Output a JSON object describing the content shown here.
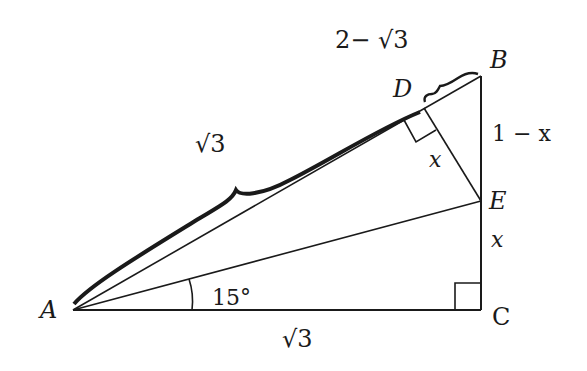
{
  "diagram": {
    "type": "geometry-triangle",
    "colors": {
      "stroke": "#1a1a1a",
      "background": "#ffffff"
    },
    "points": {
      "A": {
        "label": "A"
      },
      "B": {
        "label": "B"
      },
      "C": {
        "label": "C"
      },
      "D": {
        "label": "D"
      },
      "E": {
        "label": "E"
      }
    },
    "lengths": {
      "AD": "√3",
      "DB": "2− √3",
      "BE": "1 − x",
      "EC": "x",
      "DE": "x",
      "AC": "√3"
    },
    "angle_CAE": "15°",
    "right_angles": [
      "C",
      "D"
    ]
  }
}
